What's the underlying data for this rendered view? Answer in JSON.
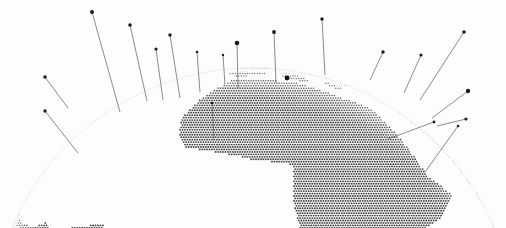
{
  "figure": {
    "title": "",
    "subtitle": "",
    "background_color": "#fdfdfd",
    "width": 506,
    "height": 228,
    "projection": "orthographic-globe-oblique",
    "map_style": "halftone-dot-matrix",
    "dot_color": "#3c3c3c",
    "land_dot_color": "#2e2e2e",
    "spike_line_color": "#5a5a5a",
    "spike_cap_color": "#1c1c1c",
    "has_axes": false,
    "has_legend": false,
    "has_gridlines": false,
    "has_text_labels": false
  },
  "chart_data": {
    "type": "scatter",
    "title": "",
    "xlabel": "",
    "ylabel": "",
    "grid": false,
    "legend_position": "none",
    "xlim": [
      0,
      506
    ],
    "ylim": [
      0,
      228
    ],
    "globe": {
      "center_x": 253,
      "center_y": 330,
      "radius": 262,
      "arc_top_y": 72,
      "limb_color": "#8a8a8a"
    },
    "landmasses": [
      {
        "name": "Eurasia",
        "region": "top-center-arc"
      },
      {
        "name": "Africa",
        "region": "center"
      },
      {
        "name": "Australia",
        "region": "bottom-left"
      },
      {
        "name": "South America",
        "region": "bottom-right"
      },
      {
        "name": "North America edge",
        "region": "right-arc"
      },
      {
        "name": "Greenland / Arctic edge",
        "region": "left-arc"
      }
    ],
    "spikes": [
      {
        "id": 1,
        "base_x": 68,
        "base_y": 108,
        "tip_x": 45,
        "tip_y": 77,
        "cap_r": 1.8,
        "height": 38
      },
      {
        "id": 2,
        "base_x": 120,
        "base_y": 112,
        "tip_x": 92,
        "tip_y": 12,
        "cap_r": 2.0,
        "height": 104
      },
      {
        "id": 3,
        "base_x": 147,
        "base_y": 101,
        "tip_x": 130,
        "tip_y": 25,
        "cap_r": 1.8,
        "height": 78
      },
      {
        "id": 4,
        "base_x": 163,
        "base_y": 100,
        "tip_x": 156,
        "tip_y": 49,
        "cap_r": 1.6,
        "height": 52
      },
      {
        "id": 5,
        "base_x": 180,
        "base_y": 98,
        "tip_x": 170,
        "tip_y": 35,
        "cap_r": 1.7,
        "height": 64
      },
      {
        "id": 6,
        "base_x": 200,
        "base_y": 92,
        "tip_x": 197,
        "tip_y": 52,
        "cap_r": 1.3,
        "height": 40
      },
      {
        "id": 7,
        "base_x": 225,
        "base_y": 85,
        "tip_x": 223,
        "tip_y": 55,
        "cap_r": 1.2,
        "height": 30
      },
      {
        "id": 8,
        "base_x": 238,
        "base_y": 88,
        "tip_x": 237,
        "tip_y": 43,
        "cap_r": 2.3,
        "height": 45
      },
      {
        "id": 9,
        "base_x": 276,
        "base_y": 83,
        "tip_x": 274,
        "tip_y": 32,
        "cap_r": 1.9,
        "height": 51
      },
      {
        "id": 10,
        "base_x": 325,
        "base_y": 75,
        "tip_x": 322,
        "tip_y": 19,
        "cap_r": 1.7,
        "height": 56
      },
      {
        "id": 11,
        "base_x": 370,
        "base_y": 80,
        "tip_x": 383,
        "tip_y": 52,
        "cap_r": 1.7,
        "height": 31
      },
      {
        "id": 12,
        "base_x": 404,
        "base_y": 93,
        "tip_x": 421,
        "tip_y": 55,
        "cap_r": 1.6,
        "height": 42
      },
      {
        "id": 13,
        "base_x": 420,
        "base_y": 100,
        "tip_x": 464,
        "tip_y": 32,
        "cap_r": 1.8,
        "height": 81
      },
      {
        "id": 14,
        "base_x": 432,
        "base_y": 118,
        "tip_x": 468,
        "tip_y": 91,
        "cap_r": 2.2,
        "height": 45
      },
      {
        "id": 15,
        "base_x": 437,
        "base_y": 126,
        "tip_x": 466,
        "tip_y": 119,
        "cap_r": 1.6,
        "height": 30
      },
      {
        "id": 16,
        "base_x": 214,
        "base_y": 140,
        "tip_x": 212,
        "tip_y": 103,
        "cap_r": 1.3,
        "height": 37
      },
      {
        "id": 17,
        "base_x": 78,
        "base_y": 153,
        "tip_x": 45,
        "tip_y": 111,
        "cap_r": 1.7,
        "height": 54
      },
      {
        "id": 18,
        "base_x": 388,
        "base_y": 139,
        "tip_x": 434,
        "tip_y": 122,
        "cap_r": 1.4,
        "height": 49
      },
      {
        "id": 19,
        "base_x": 425,
        "base_y": 172,
        "tip_x": 458,
        "tip_y": 126,
        "cap_r": 1.3,
        "height": 57
      },
      {
        "id": 20,
        "base_x": 288,
        "base_y": 78,
        "tip_x": 287,
        "tip_y": 78,
        "cap_r": 2.4,
        "height": 0
      }
    ],
    "spike_count": 20
  }
}
